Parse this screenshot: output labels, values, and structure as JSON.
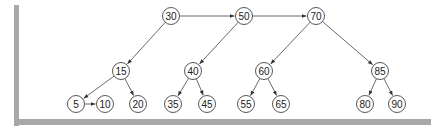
{
  "diagram": {
    "type": "skip-list-tree",
    "frame_color": "#a8a8a8",
    "line_color": "#444444",
    "nodes": [
      {
        "id": "n30",
        "label": "30",
        "x": 171,
        "y": 16
      },
      {
        "id": "n50",
        "label": "50",
        "x": 244,
        "y": 16
      },
      {
        "id": "n70",
        "label": "70",
        "x": 316,
        "y": 16
      },
      {
        "id": "n15",
        "label": "15",
        "x": 121,
        "y": 71
      },
      {
        "id": "n40",
        "label": "40",
        "x": 193,
        "y": 71
      },
      {
        "id": "n60",
        "label": "60",
        "x": 264,
        "y": 71
      },
      {
        "id": "n85",
        "label": "85",
        "x": 380,
        "y": 71
      },
      {
        "id": "n5",
        "label": "5",
        "x": 76,
        "y": 104
      },
      {
        "id": "n10",
        "label": "10",
        "x": 105,
        "y": 104
      },
      {
        "id": "n20",
        "label": "20",
        "x": 138,
        "y": 104
      },
      {
        "id": "n35",
        "label": "35",
        "x": 173,
        "y": 104
      },
      {
        "id": "n45",
        "label": "45",
        "x": 207,
        "y": 104
      },
      {
        "id": "n55",
        "label": "55",
        "x": 246,
        "y": 104
      },
      {
        "id": "n65",
        "label": "65",
        "x": 281,
        "y": 104
      },
      {
        "id": "n80",
        "label": "80",
        "x": 365,
        "y": 104
      },
      {
        "id": "n90",
        "label": "90",
        "x": 397,
        "y": 104
      }
    ],
    "edges": [
      {
        "from": "n30",
        "to": "n50"
      },
      {
        "from": "n50",
        "to": "n70"
      },
      {
        "from": "n30",
        "to": "n15"
      },
      {
        "from": "n50",
        "to": "n40"
      },
      {
        "from": "n70",
        "to": "n60"
      },
      {
        "from": "n70",
        "to": "n85"
      },
      {
        "from": "n15",
        "to": "n5"
      },
      {
        "from": "n15",
        "to": "n20"
      },
      {
        "from": "n5",
        "to": "n10"
      },
      {
        "from": "n40",
        "to": "n35"
      },
      {
        "from": "n40",
        "to": "n45"
      },
      {
        "from": "n60",
        "to": "n55"
      },
      {
        "from": "n60",
        "to": "n65"
      },
      {
        "from": "n85",
        "to": "n80"
      },
      {
        "from": "n85",
        "to": "n90"
      }
    ]
  }
}
